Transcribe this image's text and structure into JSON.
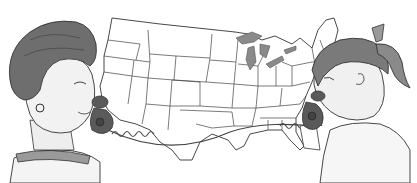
{
  "image": {
    "kind": "illustration",
    "style": "grayscale pencil and wash drawing",
    "description": "A woman and a young girl talking on old-fashioned telephones connected by a long coiled cord stretched across a map of the United States",
    "subjects": [
      {
        "role": "woman",
        "position": "left",
        "features": [
          "short swept-back dark hair",
          "hoop earring",
          "smiling",
          "holding black telephone handset"
        ]
      },
      {
        "role": "girl",
        "position": "right",
        "features": [
          "ponytail with bow",
          "holding black telephone handset",
          "facing left"
        ]
      }
    ],
    "background": "outline map of the contiguous United States with state borders; Great Lakes shaded gray",
    "connector": "coiled telephone cord spanning the map from left handset to right handset"
  },
  "colors": {
    "background": "#ffffff",
    "line": "#333333",
    "hair_dark": "#6e6e6e",
    "phone": "#5a5a5a",
    "lakes": "#8a8a8a",
    "skin_shade": "#e6e6e6"
  }
}
